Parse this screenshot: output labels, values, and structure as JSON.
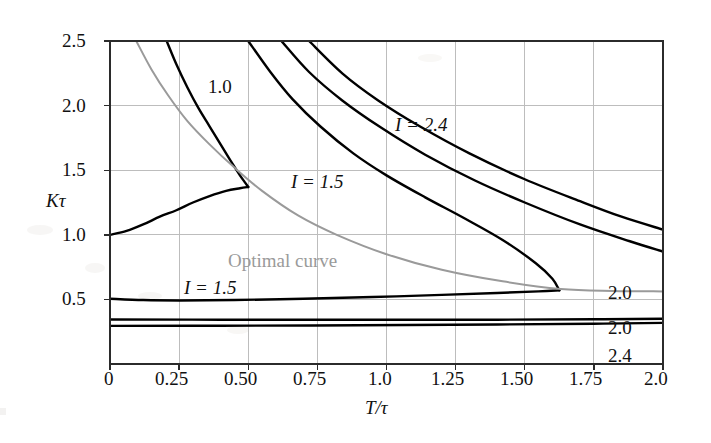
{
  "figure": {
    "background": "#ffffff",
    "axis_color": "#2b2b2b",
    "grid_color": "#bfbfbf",
    "curve_color": "#000000",
    "optimal_color": "#9a9a9a"
  },
  "chart_data": {
    "type": "line",
    "title": "",
    "xlabel": "T/τ",
    "ylabel": "Kτ",
    "xlim": [
      0,
      2.0
    ],
    "ylim": [
      0,
      2.5
    ],
    "grid": true,
    "legend": "inline-annotations",
    "xticks": [
      "0",
      "0.25",
      "0.50",
      "0.75",
      "1.0",
      "1.25",
      "1.50",
      "1.75",
      "2.0"
    ],
    "xtick_values": [
      0,
      0.25,
      0.5,
      0.75,
      1.0,
      1.25,
      1.5,
      1.75,
      2.0
    ],
    "yticks": [
      "0.5",
      "1.0",
      "1.5",
      "2.0",
      "2.5"
    ],
    "ytick_values": [
      0.5,
      1.0,
      1.5,
      2.0,
      2.5
    ],
    "annotations": [
      {
        "text": "1.0",
        "x": 0.38,
        "y": 2.18
      },
      {
        "text": "I = 2.4",
        "x": 1.05,
        "y": 1.77
      },
      {
        "text": "I = 1.5",
        "x": 0.67,
        "y": 1.55
      },
      {
        "text": "Optimal curve",
        "x": 0.44,
        "y": 1.04,
        "color": "#9a9a9a"
      },
      {
        "text": "I = 1.5",
        "x": 0.28,
        "y": 0.63
      },
      {
        "text": "2.0",
        "x": 1.79,
        "y": 0.8
      },
      {
        "text": "2.0",
        "x": 1.79,
        "y": 0.53
      },
      {
        "text": "2.4",
        "x": 1.79,
        "y": 0.27
      }
    ],
    "series": [
      {
        "name": "I = 1.0 upper branch",
        "label": "1.0",
        "color": "#000000",
        "points": [
          [
            0.205,
            2.5
          ],
          [
            0.24,
            2.32
          ],
          [
            0.28,
            2.14
          ],
          [
            0.32,
            1.98
          ],
          [
            0.36,
            1.84
          ],
          [
            0.4,
            1.7
          ],
          [
            0.44,
            1.56
          ],
          [
            0.47,
            1.46
          ],
          [
            0.49,
            1.4
          ],
          [
            0.5,
            1.37
          ]
        ]
      },
      {
        "name": "I = 1.0 lower branch",
        "label": "1.0",
        "color": "#000000",
        "points": [
          [
            0.0,
            1.0
          ],
          [
            0.06,
            1.03
          ],
          [
            0.12,
            1.08
          ],
          [
            0.18,
            1.14
          ],
          [
            0.24,
            1.19
          ],
          [
            0.3,
            1.25
          ],
          [
            0.36,
            1.3
          ],
          [
            0.42,
            1.34
          ],
          [
            0.47,
            1.36
          ],
          [
            0.5,
            1.37
          ]
        ]
      },
      {
        "name": "I = 1.5 upper branch",
        "label": "I = 1.5",
        "color": "#000000",
        "points": [
          [
            0.5,
            2.5
          ],
          [
            0.58,
            2.26
          ],
          [
            0.66,
            2.05
          ],
          [
            0.76,
            1.84
          ],
          [
            0.88,
            1.63
          ],
          [
            1.0,
            1.46
          ],
          [
            1.14,
            1.29
          ],
          [
            1.28,
            1.13
          ],
          [
            1.42,
            0.96
          ],
          [
            1.54,
            0.78
          ],
          [
            1.6,
            0.66
          ],
          [
            1.625,
            0.57
          ]
        ]
      },
      {
        "name": "I = 1.5 lower branch",
        "label": "I = 1.5",
        "color": "#000000",
        "points": [
          [
            0.0,
            0.505
          ],
          [
            0.12,
            0.495
          ],
          [
            0.25,
            0.492
          ],
          [
            0.45,
            0.495
          ],
          [
            0.7,
            0.505
          ],
          [
            0.95,
            0.518
          ],
          [
            1.2,
            0.535
          ],
          [
            1.4,
            0.55
          ],
          [
            1.55,
            0.562
          ],
          [
            1.625,
            0.57
          ]
        ]
      },
      {
        "name": "I = 2.0 upper branch",
        "label": "2.0",
        "color": "#000000",
        "points": [
          [
            0.62,
            2.5
          ],
          [
            0.72,
            2.26
          ],
          [
            0.84,
            2.04
          ],
          [
            0.98,
            1.83
          ],
          [
            1.14,
            1.62
          ],
          [
            1.32,
            1.42
          ],
          [
            1.5,
            1.25
          ],
          [
            1.7,
            1.08
          ],
          [
            1.88,
            0.95
          ],
          [
            2.0,
            0.87
          ]
        ]
      },
      {
        "name": "I = 2.0 lower branch",
        "label": "2.0",
        "color": "#000000",
        "points": [
          [
            0.0,
            0.345
          ],
          [
            0.4,
            0.343
          ],
          [
            0.9,
            0.342
          ],
          [
            1.4,
            0.343
          ],
          [
            1.75,
            0.346
          ],
          [
            2.0,
            0.35
          ]
        ]
      },
      {
        "name": "I = 2.4 upper branch",
        "label": "I = 2.4",
        "color": "#000000",
        "points": [
          [
            0.72,
            2.5
          ],
          [
            0.84,
            2.25
          ],
          [
            0.97,
            2.04
          ],
          [
            1.12,
            1.84
          ],
          [
            1.3,
            1.63
          ],
          [
            1.5,
            1.43
          ],
          [
            1.7,
            1.26
          ],
          [
            1.85,
            1.14
          ],
          [
            2.0,
            1.04
          ]
        ]
      },
      {
        "name": "I = 2.4 lower branch",
        "label": "2.4",
        "color": "#000000",
        "points": [
          [
            0.0,
            0.295
          ],
          [
            0.4,
            0.296
          ],
          [
            0.9,
            0.3
          ],
          [
            1.4,
            0.306
          ],
          [
            1.75,
            0.312
          ],
          [
            2.0,
            0.318
          ]
        ]
      },
      {
        "name": "Optimal curve",
        "label": "Optimal curve",
        "color": "#9a9a9a",
        "points": [
          [
            0.095,
            2.5
          ],
          [
            0.15,
            2.28
          ],
          [
            0.21,
            2.08
          ],
          [
            0.28,
            1.88
          ],
          [
            0.36,
            1.7
          ],
          [
            0.45,
            1.52
          ],
          [
            0.55,
            1.34
          ],
          [
            0.68,
            1.15
          ],
          [
            0.82,
            1.0
          ],
          [
            1.0,
            0.85
          ],
          [
            1.2,
            0.73
          ],
          [
            1.42,
            0.64
          ],
          [
            1.63,
            0.58
          ],
          [
            1.82,
            0.565
          ],
          [
            2.0,
            0.562
          ]
        ]
      }
    ]
  }
}
